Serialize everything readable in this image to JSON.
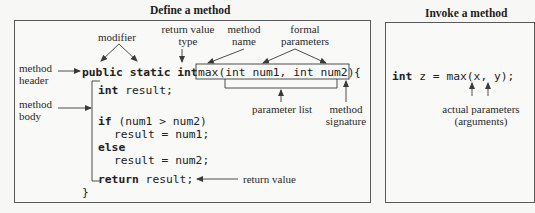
{
  "define_panel": {
    "title": "Define a method",
    "labels": {
      "modifier": "modifier",
      "return_value_type_line1": "return value",
      "return_value_type_line2": "type",
      "method_name_line1": "method",
      "method_name_line2": "name",
      "formal_parameters_line1": "formal",
      "formal_parameters_line2": "parameters",
      "method_header_line1": "method",
      "method_header_line2": "header",
      "method_body_line1": "method",
      "method_body_line2": "body",
      "parameter_list": "parameter list",
      "method_signature_line1": "method",
      "method_signature_line2": "signature",
      "return_value": "return value"
    },
    "code": {
      "header_public": "public",
      "header_static": "static",
      "header_int": "int",
      "header_signature": "max(int num1, int num2)",
      "header_brace": "{",
      "line1": "int result;",
      "line2": "if (num1 > num2)",
      "line3": "result = num1;",
      "line4": "else",
      "line5": "result = num2;",
      "line6_kw": "return",
      "line6_rest": " result;",
      "closing_brace": "}"
    }
  },
  "invoke_panel": {
    "title": "Invoke a method",
    "code": "int z = max(x, y);",
    "labels": {
      "actual_parameters_line1": "actual parameters",
      "actual_parameters_line2": "(arguments)"
    }
  },
  "colors": {
    "background": "#f7f7f5",
    "border": "#5a5a5a",
    "text": "#2a2a2a",
    "arrow": "#3a3a3a"
  }
}
